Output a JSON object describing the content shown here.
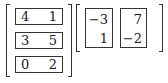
{
  "left_matrix": {
    "description": "3x2 matrix with rows boxed",
    "rows": [
      {
        "a": "4",
        "b": "1"
      },
      {
        "a": "3",
        "b": "5"
      },
      {
        "a": "0",
        "b": "2"
      }
    ]
  },
  "right_matrix": {
    "description": "2x2 matrix with columns boxed",
    "columns": [
      {
        "top": "−3",
        "bottom": "1"
      },
      {
        "top": "7",
        "bottom": "−2"
      }
    ]
  }
}
